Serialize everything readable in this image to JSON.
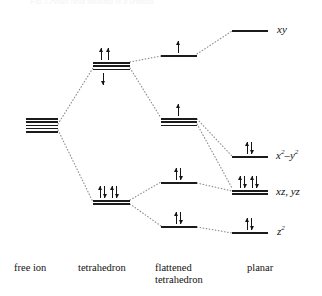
{
  "figure": {
    "type": "crystal-field-splitting-energy-level-diagram",
    "cut_off_caption": "Fig. Crystal field splitting of d orbitals",
    "columns": [
      {
        "id": "free-ion",
        "label": "free ion"
      },
      {
        "id": "tetrahedron",
        "label": "tetrahedron"
      },
      {
        "id": "flattened-tetrahedron",
        "label": "flattened",
        "label_line2": "tetrahedron"
      },
      {
        "id": "planar",
        "label": "planar"
      }
    ],
    "levels": [
      {
        "id": "free-ion-d",
        "column": "free-ion",
        "degeneracy": 5,
        "electrons": "",
        "orbital_label": ""
      },
      {
        "id": "tet-t2",
        "column": "tetrahedron",
        "degeneracy": 3,
        "electrons": "two-up-above-one-down-below",
        "orbital_label": ""
      },
      {
        "id": "tet-e",
        "column": "tetrahedron",
        "degeneracy": 2,
        "electrons": "two-pairs",
        "orbital_label": ""
      },
      {
        "id": "flat-top",
        "column": "flattened-tetrahedron",
        "degeneracy": 1,
        "electrons": "one-up",
        "orbital_label": ""
      },
      {
        "id": "flat-upper-mid",
        "column": "flattened-tetrahedron",
        "degeneracy": 3,
        "electrons": "one-up",
        "orbital_label": ""
      },
      {
        "id": "flat-lower-mid",
        "column": "flattened-tetrahedron",
        "degeneracy": 1,
        "electrons": "one-pair",
        "orbital_label": ""
      },
      {
        "id": "flat-bottom",
        "column": "flattened-tetrahedron",
        "degeneracy": 1,
        "electrons": "one-pair",
        "orbital_label": ""
      },
      {
        "id": "planar-xy",
        "column": "planar",
        "degeneracy": 1,
        "electrons": "",
        "orbital_label": "xy"
      },
      {
        "id": "planar-x2y2",
        "column": "planar",
        "degeneracy": 1,
        "electrons": "one-pair",
        "orbital_label": "x2-y2"
      },
      {
        "id": "planar-xzyz",
        "column": "planar",
        "degeneracy": 2,
        "electrons": "two-pairs",
        "orbital_label": "xz, yz"
      },
      {
        "id": "planar-z2",
        "column": "planar",
        "degeneracy": 1,
        "electrons": "one-pair",
        "orbital_label": "z2"
      }
    ],
    "orbital_labels": {
      "xy": "xy",
      "x2_y2_base": "x",
      "x2_y2_sup1": "2",
      "x2_y2_mid": "–y",
      "x2_y2_sup2": "2",
      "xz_yz": "xz, yz",
      "z2_base": "z",
      "z2_sup": "2"
    },
    "colors": {
      "level_line": "#1b1b1b",
      "arrow": "#141414",
      "correlation_line": "#8d8d8d",
      "background": "#ffffff",
      "text": "#111111"
    }
  }
}
